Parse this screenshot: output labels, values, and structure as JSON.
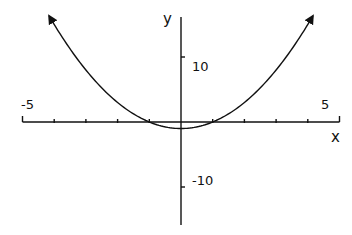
{
  "chart_data": {
    "type": "line",
    "title": "",
    "xlabel": "x",
    "ylabel": "y",
    "xlim": [
      -5,
      5
    ],
    "ylim": [
      -18,
      17
    ],
    "x_tick_labels": [
      "-5",
      "5"
    ],
    "y_tick_labels": [
      "10",
      "-10"
    ],
    "x_ticks": [
      -5,
      -4,
      -3,
      -2,
      -1,
      0,
      1,
      2,
      3,
      4,
      5
    ],
    "y_ticks": [
      10,
      -10
    ],
    "grid": false,
    "legend": null,
    "series": [
      {
        "name": "y = x^2 - 1",
        "x": [
          -4.16,
          -4,
          -3,
          -2,
          -1,
          -0.5,
          0,
          0.5,
          1,
          2,
          3,
          4,
          4.16
        ],
        "values": [
          16.3,
          15,
          8,
          3,
          0,
          -0.75,
          -1,
          -0.75,
          0,
          3,
          8,
          15,
          16.3
        ],
        "arrows_at_ends": true
      }
    ]
  },
  "labels": {
    "x_axis": "x",
    "y_axis": "y",
    "x_min": "-5",
    "x_max": "5",
    "y_pos": "10",
    "y_neg": "-10"
  },
  "colors": {
    "line": "#111111",
    "background": "#ffffff"
  }
}
